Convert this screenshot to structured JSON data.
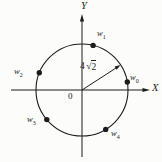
{
  "figure": {
    "colors": {
      "ink": "#1c1c1c",
      "paper": "#fcfcfa"
    },
    "axes": {
      "x_label": "X",
      "y_label": "Y",
      "origin_label": "0"
    },
    "radius": {
      "display": "4√2",
      "coefficient": "4",
      "radical_sign": "√",
      "radicand": "2",
      "arrow_angle_deg": 33
    },
    "points": [
      {
        "id": "w0",
        "base": "w",
        "subscript": "0",
        "angle_deg": 10
      },
      {
        "id": "w1",
        "base": "w",
        "subscript": "1",
        "angle_deg": 76
      },
      {
        "id": "w2",
        "base": "w",
        "subscript": "2",
        "angle_deg": 158
      },
      {
        "id": "w3",
        "base": "w",
        "subscript": "3",
        "angle_deg": 220
      },
      {
        "id": "w4",
        "base": "w",
        "subscript": "4",
        "angle_deg": 301
      }
    ]
  }
}
